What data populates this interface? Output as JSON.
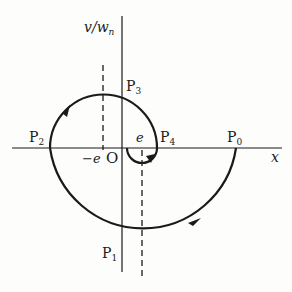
{
  "diagram": {
    "y_axis_label": "v/w",
    "y_axis_label_sub": "n",
    "x_axis_label": "x",
    "origin_label": "O",
    "neg_e_label": "−e",
    "e_label": "e",
    "points": [
      {
        "name": "P",
        "sub": "0"
      },
      {
        "name": "P",
        "sub": "1"
      },
      {
        "name": "P",
        "sub": "2"
      },
      {
        "name": "P",
        "sub": "3"
      },
      {
        "name": "P",
        "sub": "4"
      }
    ],
    "colors": {
      "stroke": "#1a1a1a",
      "background": "#fdfdfb"
    }
  }
}
